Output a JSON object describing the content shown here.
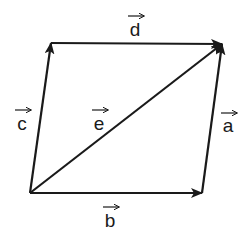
{
  "diagram": {
    "title": "",
    "type": "vector-parallelogram",
    "points": {
      "bottom_left": [
        30,
        193
      ],
      "bottom_right": [
        202,
        193
      ],
      "top_right": [
        222,
        44
      ],
      "top_left": [
        51,
        43
      ]
    },
    "vectors": [
      {
        "name": "a",
        "label": "a",
        "from": "bottom_right",
        "to": "top_right",
        "label_pos": [
          228,
          132
        ],
        "arrow_pos": [
          229,
          113
        ]
      },
      {
        "name": "b",
        "label": "b",
        "from": "bottom_left",
        "to": "bottom_right",
        "label_pos": [
          110,
          227
        ],
        "arrow_pos": [
          111,
          207
        ]
      },
      {
        "name": "c",
        "label": "c",
        "from": "bottom_left",
        "to": "top_left",
        "label_pos": [
          22,
          130
        ],
        "arrow_pos": [
          23,
          110
        ]
      },
      {
        "name": "d",
        "label": "d",
        "from": "top_left",
        "to": "top_right",
        "label_pos": [
          135,
          36
        ],
        "arrow_pos": [
          136,
          16
        ]
      },
      {
        "name": "e",
        "label": "e",
        "from": "bottom_left",
        "to": "top_right",
        "label_pos": [
          99,
          130
        ],
        "arrow_pos": [
          100,
          110
        ]
      }
    ],
    "colors": {
      "stroke": "#1a1a1a",
      "background": "#ffffff"
    }
  }
}
